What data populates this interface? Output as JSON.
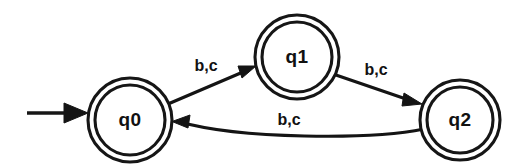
{
  "diagram": {
    "kind": "finite-state-automaton",
    "background_color": "#ffffff",
    "stroke_color": "#141414",
    "states": [
      {
        "id": "q0",
        "label": "q0",
        "accepting": true,
        "start": true,
        "cx": 130,
        "cy": 120,
        "r_outer": 42,
        "r_inner": 35
      },
      {
        "id": "q1",
        "label": "q1",
        "accepting": true,
        "start": false,
        "cx": 297,
        "cy": 57,
        "r_outer": 42,
        "r_inner": 35
      },
      {
        "id": "q2",
        "label": "q2",
        "accepting": true,
        "start": false,
        "cx": 460,
        "cy": 120,
        "r_outer": 40,
        "r_inner": 33
      }
    ],
    "transitions": [
      {
        "from": "q0",
        "to": "q1",
        "label": "b,c",
        "label_x": 206,
        "label_y": 67,
        "shape": "straight"
      },
      {
        "from": "q1",
        "to": "q2",
        "label": "b,c",
        "label_x": 376,
        "label_y": 71,
        "shape": "straight"
      },
      {
        "from": "q2",
        "to": "q0",
        "label": "b,c",
        "label_x": 289,
        "label_y": 121,
        "shape": "curved"
      }
    ],
    "start_arrow": {
      "label": "start-transition",
      "x1": 27,
      "y1": 113,
      "x2": 88,
      "y2": 113
    },
    "alphabet": [
      "b",
      "c"
    ]
  }
}
